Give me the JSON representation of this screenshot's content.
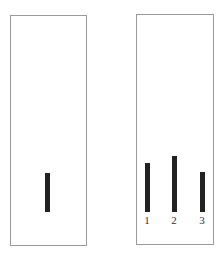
{
  "diagram": {
    "colors": {
      "bar": "#222222",
      "frame": "#9a9a9a",
      "background": "#ffffff"
    },
    "left_panel": {
      "standard_line": {
        "relative_height": 39
      }
    },
    "right_panel": {
      "comparison_lines": [
        {
          "label": "1",
          "relative_height": 49
        },
        {
          "label": "2",
          "relative_height": 56
        },
        {
          "label": "3",
          "relative_height": 40
        }
      ]
    }
  }
}
